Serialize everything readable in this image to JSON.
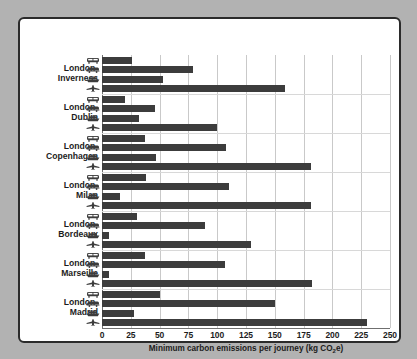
{
  "chart_data": {
    "type": "bar",
    "orientation": "horizontal",
    "title": "",
    "xlabel": "Minimum carbon emissions per journey (kg CO2e)",
    "ylabel": "",
    "xlim": [
      0,
      250
    ],
    "xticks": [
      0,
      25,
      50,
      75,
      100,
      125,
      150,
      175,
      200,
      225,
      250
    ],
    "grid": true,
    "legend_position": "none",
    "categories": [
      "London-Inverness",
      "London-Dublin",
      "London-Copenhagen",
      "London-Milan",
      "London-Bordeaux",
      "London-Marseille",
      "London-Madrid"
    ],
    "series": [
      {
        "name": "Train",
        "icon": "train-icon",
        "values": [
          26,
          20,
          37,
          38,
          30,
          37,
          50
        ]
      },
      {
        "name": "Coach",
        "icon": "coach-icon",
        "values": [
          79,
          46,
          108,
          110,
          89,
          107,
          150
        ]
      },
      {
        "name": "Ferry",
        "icon": "ferry-icon",
        "values": [
          53,
          32,
          47,
          16,
          6,
          6,
          28
        ]
      },
      {
        "name": "Plane",
        "icon": "plane-icon",
        "values": [
          159,
          100,
          181,
          181,
          129,
          182,
          230
        ]
      }
    ]
  },
  "axis": {
    "xlabel_prefix": "Minimum carbon emissions per journey (kg CO",
    "xlabel_sub": "2",
    "xlabel_suffix": "e)",
    "ticks": [
      "0",
      "25",
      "50",
      "75",
      "100",
      "125",
      "150",
      "175",
      "200",
      "225",
      "250"
    ]
  },
  "ylabels": [
    {
      "line1": "London-",
      "line2": "Inverness"
    },
    {
      "line1": "London-",
      "line2": "Dublin"
    },
    {
      "line1": "London-",
      "line2": "Copenhagen"
    },
    {
      "line1": "London-",
      "line2": "Milan"
    },
    {
      "line1": "London-",
      "line2": "Bordeaux"
    },
    {
      "line1": "London-",
      "line2": "Marseille"
    },
    {
      "line1": "London-",
      "line2": "Madrid"
    }
  ],
  "colors": {
    "bar": "#3c3c3c",
    "grid": "#c9c9c9",
    "axis": "#6f6f6f",
    "panel_bg": "#ffffff",
    "page_bg": "#b2b2b2",
    "border": "#2b2b2b",
    "text": "#1c1c1c"
  }
}
